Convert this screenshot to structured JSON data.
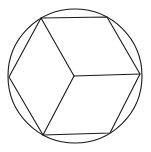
{
  "diagram": {
    "stroke_color": "#1a1a1a",
    "background": "#ffffff",
    "circle": {
      "cx": 75,
      "cy": 76,
      "r": 67
    },
    "center": {
      "x": 74,
      "y": 76
    },
    "hexagon_points": "41,18 107,17 140,74 110,133 43,135 9,77",
    "spokes": [
      {
        "x2": 41,
        "y2": 18
      },
      {
        "x2": 140,
        "y2": 74
      },
      {
        "x2": 43,
        "y2": 135
      }
    ]
  }
}
